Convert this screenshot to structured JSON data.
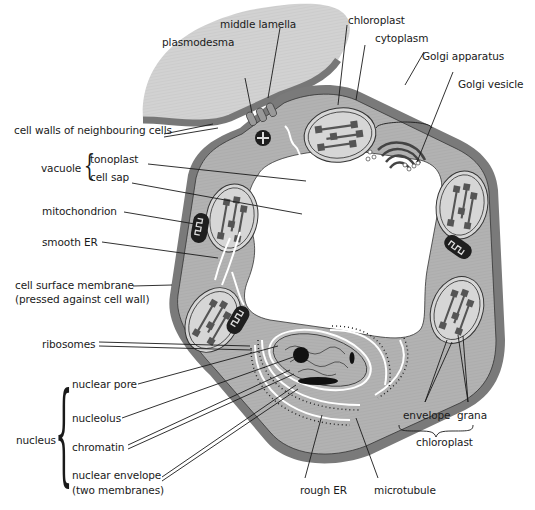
{
  "diagram": {
    "title": "",
    "colors": {
      "cell_wall": "#7a7a7a",
      "cytoplasm": "#b3b3b3",
      "neighbour_cell": "#d4d4d4",
      "vacuole": "#ffffff",
      "chloroplast_fill": "#d6d6d6",
      "organelle_dark": "#222222",
      "leader_line": "#1a1a1a"
    },
    "labels": {
      "middle_lamella": "middle lamella",
      "plasmodesma": "plasmodesma",
      "chloroplast_top": "chloroplast",
      "cytoplasm": "cytoplasm",
      "golgi_apparatus": "Golgi apparatus",
      "golgi_vesicle": "Golgi vesicle",
      "cell_walls_neighbouring": "cell walls of neighbouring cells",
      "vacuole": "vacuole",
      "tonoplast": "tonoplast",
      "cell_sap": "cell sap",
      "mitochondrion": "mitochondrion",
      "smooth_er": "smooth ER",
      "cell_surface_membrane_1": "cell surface membrane",
      "cell_surface_membrane_2": "(pressed against cell wall)",
      "ribosomes": "ribosomes",
      "nucleus": "nucleus",
      "nuclear_pore": "nuclear pore",
      "nucleolus": "nucleolus",
      "chromatin": "chromatin",
      "nuclear_envelope_1": "nuclear envelope",
      "nuclear_envelope_2": "(two membranes)",
      "rough_er": "rough ER",
      "microtubule": "microtubule",
      "envelope": "envelope",
      "grana": "grana",
      "chloroplast_bottom": "chloroplast"
    }
  }
}
